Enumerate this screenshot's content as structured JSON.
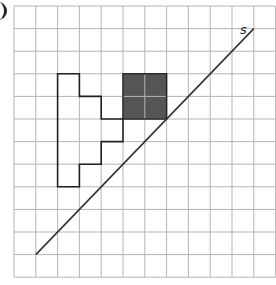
{
  "diagram": {
    "label": "s",
    "grid": {
      "cols": 12,
      "rows": 12,
      "origin_x": 14,
      "origin_y": 6,
      "cell_w": 21.8,
      "cell_h": 22.6
    },
    "shaded_square": {
      "col": 5,
      "row": 3,
      "size": 2,
      "fill": "#555555"
    },
    "outline_shape": [
      [
        2,
        3
      ],
      [
        3,
        3
      ],
      [
        3,
        4
      ],
      [
        4,
        4
      ],
      [
        4,
        5
      ],
      [
        5,
        5
      ],
      [
        5,
        6
      ],
      [
        4,
        6
      ],
      [
        4,
        7
      ],
      [
        3,
        7
      ],
      [
        3,
        8
      ],
      [
        2,
        8
      ]
    ],
    "mirror_line": {
      "from": [
        1,
        11
      ],
      "to": [
        11,
        1
      ]
    },
    "colors": {
      "grid": "#b5b5b5",
      "line": "#333333"
    }
  }
}
